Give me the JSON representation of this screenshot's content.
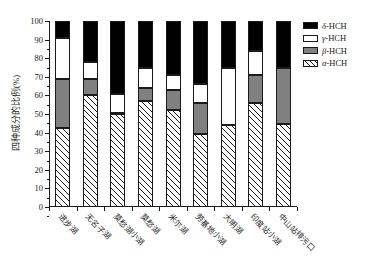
{
  "chart_data": {
    "type": "bar",
    "subtype": "stacked-percentage",
    "title": "",
    "xlabel": "",
    "ylabel": "四种成分的比例(%)",
    "ylim": [
      0,
      100
    ],
    "ytick_step": 10,
    "ytick_labels": [
      "0",
      "10",
      "20",
      "30",
      "40",
      "50",
      "60",
      "70",
      "80",
      "90",
      "100"
    ],
    "grid": false,
    "legend_position": "top-right",
    "categories": [
      "进步湖",
      "无名子湖",
      "莫愁湖小湖",
      "莫愁湖",
      "米尔湖",
      "劳基地小湖",
      "大明湖",
      "印度站小湖",
      "中山站排污口"
    ],
    "series": [
      {
        "name": "α-HCH",
        "fill": "hatched",
        "color": "#ffffff",
        "values": [
          42.5,
          60.0,
          50.0,
          57.0,
          52.0,
          39.0,
          44.0,
          56.0,
          44.5
        ]
      },
      {
        "name": "β-HCH",
        "fill": "solid",
        "color": "#808080",
        "values": [
          26.5,
          9.0,
          0.5,
          7.0,
          11.0,
          17.0,
          0.0,
          15.0,
          30.5
        ]
      },
      {
        "name": "γ-HCH",
        "fill": "solid",
        "color": "#ffffff",
        "values": [
          22.0,
          9.0,
          10.5,
          11.0,
          8.0,
          10.0,
          31.0,
          13.0,
          0.0
        ]
      },
      {
        "name": "δ-HCH",
        "fill": "solid",
        "color": "#000000",
        "values": [
          9.0,
          22.0,
          39.0,
          25.0,
          29.0,
          34.0,
          25.0,
          16.0,
          25.0
        ]
      }
    ],
    "cumulative_tops": [
      {
        "category": "进步湖",
        "alpha_top": 42.5,
        "beta_top": 69.0,
        "gamma_top": 91.0,
        "delta_top": 100
      },
      {
        "category": "无名子湖",
        "alpha_top": 60.0,
        "beta_top": 69.0,
        "gamma_top": 78.0,
        "delta_top": 100
      },
      {
        "category": "莫愁湖小湖",
        "alpha_top": 50.0,
        "beta_top": 50.5,
        "gamma_top": 61.0,
        "delta_top": 100
      },
      {
        "category": "莫愁湖",
        "alpha_top": 57.0,
        "beta_top": 64.0,
        "gamma_top": 75.0,
        "delta_top": 100
      },
      {
        "category": "米尔湖",
        "alpha_top": 52.0,
        "beta_top": 63.0,
        "gamma_top": 71.0,
        "delta_top": 100
      },
      {
        "category": "劳基地小湖",
        "alpha_top": 39.0,
        "beta_top": 56.0,
        "gamma_top": 66.0,
        "delta_top": 100
      },
      {
        "category": "大明湖",
        "alpha_top": 44.0,
        "beta_top": 44.0,
        "gamma_top": 75.0,
        "delta_top": 100
      },
      {
        "category": "印度站小湖",
        "alpha_top": 56.0,
        "beta_top": 71.0,
        "gamma_top": 84.0,
        "delta_top": 100
      },
      {
        "category": "中山站排污口",
        "alpha_top": 44.5,
        "beta_top": 75.0,
        "gamma_top": 75.0,
        "delta_top": 100
      }
    ],
    "legend": [
      {
        "label_greek": "δ",
        "label_rest": "-HCH",
        "swatch": "black"
      },
      {
        "label_greek": "γ",
        "label_rest": "-HCH",
        "swatch": "white"
      },
      {
        "label_greek": "β",
        "label_rest": "-HCH",
        "swatch": "gray"
      },
      {
        "label_greek": "α",
        "label_rest": "-HCH",
        "swatch": "hatched"
      }
    ]
  }
}
